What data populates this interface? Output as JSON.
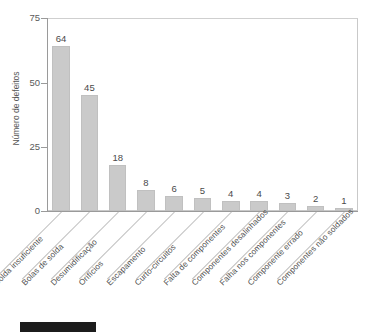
{
  "chart_data": {
    "type": "bar",
    "title": "",
    "subtitle": "",
    "xlabel": "",
    "ylabel": "Número de defeitos",
    "ylim": [
      0,
      75
    ],
    "yticks": [
      0,
      25,
      50,
      75
    ],
    "ytick_labels": [
      "0",
      "25",
      "50",
      "75"
    ],
    "grid": false,
    "legend": false,
    "orientation": "vertical",
    "sorted": "descending",
    "bar_color": "#cacaca",
    "categories": [
      "Solda insuficiente",
      "Bolas de solda",
      "Desumidificação",
      "Orifícios",
      "Escapamento",
      "Curto-circuitos",
      "Falta de componentes",
      "Componentes desalinhados",
      "Falha nos componentes",
      "Componente errado",
      "Componentes não soldados"
    ],
    "values": [
      64,
      45,
      18,
      8,
      6,
      5,
      4,
      4,
      3,
      2,
      1
    ],
    "data_labels": [
      "64",
      "45",
      "18",
      "8",
      "6",
      "5",
      "4",
      "4",
      "3",
      "2",
      "1"
    ]
  },
  "axes": {
    "y_title": "Número de defeitos",
    "y_ticks": [
      {
        "label": "75",
        "value": 75
      },
      {
        "label": "50",
        "value": 50
      },
      {
        "label": "25",
        "value": 25
      },
      {
        "label": "0",
        "value": 0
      }
    ]
  },
  "annotations": {
    "footer_block": ""
  },
  "colors": {
    "bar_fill": "#cacaca",
    "bar_stroke": "#c0c0c0",
    "axis": "#9a9a9a",
    "frame": "#c9c9c9",
    "text": "#4a4a4a",
    "leader_line": "#bdbdbd",
    "footer_block": "#1c1c1c"
  }
}
